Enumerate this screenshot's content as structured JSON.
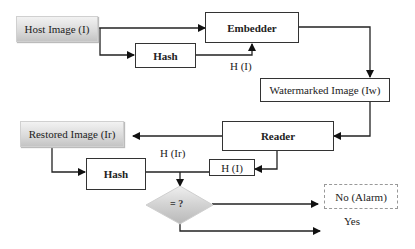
{
  "diagram": {
    "nodes": {
      "host_image": "Host Image (I)",
      "embedder": "Embedder",
      "hash_top": "Hash",
      "watermarked_image": "Watermarked Image (Iw)",
      "reader": "Reader",
      "restored_image": "Restored Image (Ir)",
      "hash_bottom": "Hash",
      "h_i_box": "H (I)",
      "decision": "= ?",
      "no_alarm": "No (Alarm)"
    },
    "edge_labels": {
      "h_i": "H (I)",
      "h_ir": "H (Ir)",
      "yes": "Yes"
    },
    "colors": {
      "stroke": "#333333",
      "gradient_light": "#f2f2f2",
      "gradient_dark": "#c4c4c4",
      "dashed_border": "#999999"
    }
  }
}
